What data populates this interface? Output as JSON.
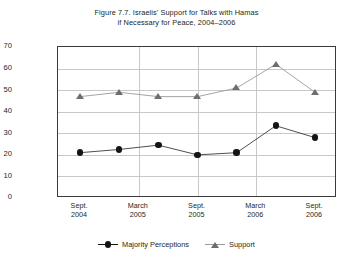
{
  "chart_data": {
    "type": "line",
    "title": "Figure 7.7. Israelis' Support for Talks with Hamas if Necessary for Peace, 2004–2006",
    "title_line1": "Figure 7.7. Israelis' Support for Talks with Hamas",
    "title_line2": "if Necessary for Peace, 2004–2006",
    "xlabel": "",
    "ylabel": "Percent",
    "ylim": [
      0,
      70
    ],
    "ytick_labels": [
      "0",
      "10",
      "20",
      "30",
      "40",
      "50",
      "60",
      "70"
    ],
    "ytick_values": [
      0,
      10,
      20,
      30,
      40,
      50,
      60,
      70
    ],
    "grid": "horizontal-and-vertical",
    "legend_position": "bottom-center",
    "x": [
      0,
      1,
      2,
      3,
      4,
      5,
      6
    ],
    "xtick_labels": [
      {
        "line1": "Sept.",
        "line2": "2004"
      },
      {
        "line1": "March",
        "line2": "2005"
      },
      {
        "line1": "Sept.",
        "line2": "2005"
      },
      {
        "line1": "March",
        "line2": "2006"
      },
      {
        "line1": "Sept.",
        "line2": "2006"
      }
    ],
    "xtick_positions": [
      0,
      1.5,
      3,
      4.5,
      6
    ],
    "series": [
      {
        "name": "Majority Perceptions",
        "marker": "circle",
        "color": "#141414",
        "values": [
          21,
          22.5,
          24.5,
          20,
          21,
          33.5,
          28
        ]
      },
      {
        "name": "Support",
        "marker": "triangle",
        "color": "#6e6e6e",
        "values": [
          47,
          49,
          47,
          47,
          51,
          62,
          49
        ]
      }
    ]
  },
  "colors": {
    "majority_perceptions": "#141414",
    "support": "#6e6e6e",
    "gridline": "#c8c8c8",
    "frame": "#3a3a3a",
    "text": "#231f20",
    "background": "#ffffff"
  }
}
